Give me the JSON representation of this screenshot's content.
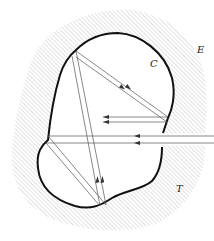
{
  "figure": {
    "type": "cavity-ray-diagram",
    "labels": {
      "cavity": "C",
      "exterior": "E",
      "wall": "T"
    },
    "colors": {
      "boundary": "#111111",
      "rays": "#444444",
      "hatch": "#b0b0b0",
      "background": "#ffffff"
    }
  }
}
